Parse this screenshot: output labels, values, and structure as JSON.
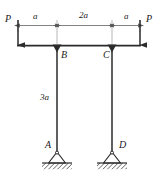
{
  "figure": {
    "type": "structural-frame-diagram",
    "colors": {
      "line": "#2b2b2b",
      "thin_line": "#6e6e6e",
      "label": "#1a1a1a",
      "hatch": "#333333",
      "background": "#ffffff"
    },
    "loads": [
      {
        "id": "load-left",
        "label": "P",
        "direction": "down"
      },
      {
        "id": "load-right",
        "label": "P",
        "direction": "down"
      }
    ],
    "dimensions": [
      {
        "id": "dim-left",
        "label": "a",
        "segment": "left-overhang"
      },
      {
        "id": "dim-middle",
        "label": "2a",
        "segment": "beam-span-BC"
      },
      {
        "id": "dim-right",
        "label": "a",
        "segment": "right-overhang"
      },
      {
        "id": "dim-height",
        "label": "3a",
        "segment": "column-height-AB"
      }
    ],
    "joints": [
      {
        "id": "joint-b",
        "label": "B",
        "marker": "filled-triangle"
      },
      {
        "id": "joint-c",
        "label": "C",
        "marker": "filled-triangle"
      }
    ],
    "supports": [
      {
        "id": "support-a",
        "label": "A",
        "kind": "pin"
      },
      {
        "id": "support-d",
        "label": "D",
        "kind": "pin"
      }
    ]
  }
}
